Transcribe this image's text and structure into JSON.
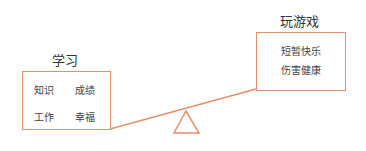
{
  "diagram": {
    "type": "seesaw-comparison",
    "stroke_color": "#e0906a",
    "left": {
      "title": "学习",
      "items": [
        "知识",
        "成绩",
        "工作",
        "幸福"
      ]
    },
    "right": {
      "title": "玩游戏",
      "items": [
        "短暂快乐",
        "伤害健康"
      ]
    }
  }
}
